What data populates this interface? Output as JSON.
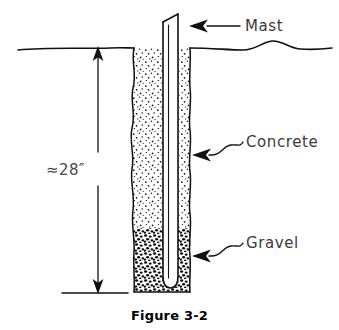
{
  "figure": {
    "caption": "Figure 3-2"
  },
  "labels": {
    "mast": "Mast",
    "concrete": "Concrete",
    "gravel": "Gravel"
  },
  "dimension": {
    "depth_label": "≈28″",
    "value": 28,
    "unit": "inch",
    "approximate": true,
    "measures": "ground level to bottom of hole"
  },
  "colors": {
    "ink": "#111111",
    "label_text": "#3a3a3a",
    "caption_text": "#000000",
    "background": "#ffffff"
  },
  "diagram_elements": {
    "ground_line": "wavy horizontal grade line",
    "hole": "vertical excavated hole with irregular walls",
    "mast_shape": "hollow tube with beveled top and rounded bottom",
    "concrete_fill": "fine sparse stipple texture, upper portion of hole",
    "gravel_fill": "dense coarse stipple texture, lower portion of hole",
    "leader_style": "curved S-leader with solid arrowhead"
  }
}
